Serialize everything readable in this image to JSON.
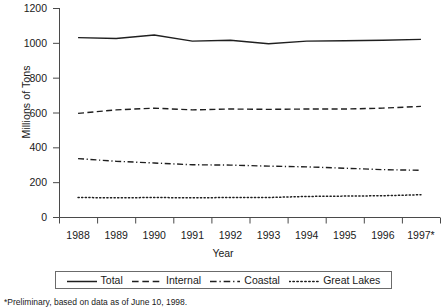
{
  "chart_data": {
    "type": "line",
    "title": "",
    "xlabel": "Year",
    "ylabel": "Millions of Tons",
    "ylim": [
      0,
      1200
    ],
    "ytick_values": [
      0,
      200,
      400,
      600,
      800,
      1000,
      1200
    ],
    "ytick_labels": [
      "0",
      "200",
      "400",
      "600",
      "800",
      "1000",
      "1200"
    ],
    "grid": false,
    "legend_position": "bottom",
    "categories": [
      "1988",
      "1989",
      "1990",
      "1991",
      "1992",
      "1993",
      "1994",
      "1995",
      "1996",
      "1997*"
    ],
    "x": [
      1988,
      1989,
      1990,
      1991,
      1992,
      1993,
      1994,
      1995,
      1996,
      1997
    ],
    "series": [
      {
        "name": "Total",
        "style": "solid",
        "values": [
          1030,
          1025,
          1045,
          1010,
          1015,
          995,
          1010,
          1012,
          1015,
          1020
        ]
      },
      {
        "name": "Internal",
        "style": "dashed",
        "values": [
          595,
          615,
          625,
          615,
          620,
          618,
          620,
          620,
          625,
          635
        ]
      },
      {
        "name": "Coastal",
        "style": "dashdot",
        "values": [
          335,
          320,
          310,
          300,
          298,
          292,
          288,
          280,
          272,
          268
        ]
      },
      {
        "name": "Great Lakes",
        "style": "dotted",
        "values": [
          112,
          110,
          112,
          110,
          112,
          112,
          118,
          120,
          122,
          128
        ]
      }
    ]
  },
  "axis": {
    "y_title": "Millions of Tons",
    "x_title": "Year"
  },
  "legend": {
    "items": [
      {
        "label": "Total",
        "style": "solid"
      },
      {
        "label": "Internal",
        "style": "dashed"
      },
      {
        "label": "Coastal",
        "style": "dashdot"
      },
      {
        "label": "Great Lakes",
        "style": "dotted"
      }
    ]
  },
  "footnote": "*Preliminary, based on data as of June 10, 1998."
}
